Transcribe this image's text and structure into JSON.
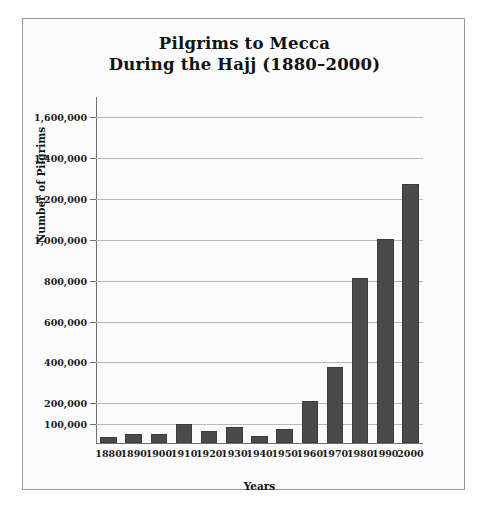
{
  "chart_data": {
    "type": "bar",
    "title_lines": [
      "Pilgrims to Mecca",
      "During the Hajj (1880–2000)"
    ],
    "xlabel": "Years",
    "ylabel": "Number of Pilgrims",
    "categories": [
      "1880",
      "1890",
      "1900",
      "1910",
      "1920",
      "1930",
      "1940",
      "1950",
      "1960",
      "1970",
      "1980",
      "1990",
      "2000"
    ],
    "values": [
      30000,
      45000,
      45000,
      95000,
      60000,
      80000,
      35000,
      70000,
      205000,
      370000,
      810000,
      1000000,
      1270000
    ],
    "ytick_labels": [
      "1,600,000",
      "1,400,000",
      "1,200,000",
      "1,000,000",
      "800,000",
      "600,000",
      "400,000",
      "200,000",
      "100,000"
    ],
    "ytick_values": [
      1600000,
      1400000,
      1200000,
      1000000,
      800000,
      600000,
      400000,
      200000,
      100000
    ],
    "ylim": [
      0,
      1700000
    ],
    "grid": true,
    "legend": "none",
    "bar_color": "#4a4a4a",
    "grid_color": "#b9b9b9",
    "background_color": "#fbfbfb",
    "frame_color": "#9a9a9a"
  }
}
